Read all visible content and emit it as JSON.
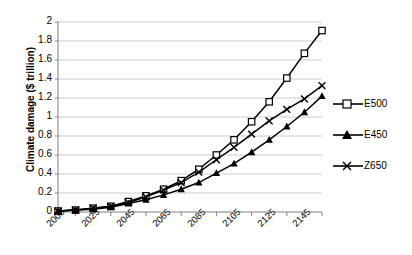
{
  "chart_data": {
    "type": "line",
    "title": "",
    "xlabel": "",
    "ylabel": "Climate damage ($ trillion)",
    "xlim": [
      2005,
      2155
    ],
    "ylim": [
      0,
      2
    ],
    "ytick_values": [
      0,
      0.2,
      0.4,
      0.6,
      0.8,
      1,
      1.2,
      1.4,
      1.6,
      1.8,
      2
    ],
    "ytick_labels": [
      "0",
      "0.2",
      "0.4",
      "0.6",
      "0.8",
      "1",
      "1.2",
      "1.4",
      "1.6",
      "1.8",
      "2"
    ],
    "xtick_labels": [
      "2005",
      "2025",
      "2045",
      "2065",
      "2085",
      "2105",
      "2125",
      "2145"
    ],
    "xtick_values": [
      2005,
      2025,
      2045,
      2065,
      2085,
      2105,
      2125,
      2145
    ],
    "x_minor_step": 10,
    "grid": "horizontal",
    "legend_position": "right",
    "x": [
      2005,
      2015,
      2025,
      2035,
      2045,
      2055,
      2065,
      2075,
      2085,
      2095,
      2105,
      2115,
      2125,
      2135,
      2145,
      2155
    ],
    "series": [
      {
        "name": "E500",
        "marker": "open-square",
        "values": [
          0.01,
          0.02,
          0.04,
          0.06,
          0.11,
          0.17,
          0.24,
          0.33,
          0.45,
          0.6,
          0.76,
          0.95,
          1.16,
          1.41,
          1.67,
          1.91
        ]
      },
      {
        "name": "E450",
        "marker": "filled-triangle",
        "values": [
          0.01,
          0.02,
          0.03,
          0.05,
          0.09,
          0.13,
          0.18,
          0.24,
          0.31,
          0.41,
          0.51,
          0.63,
          0.76,
          0.9,
          1.05,
          1.22
        ]
      },
      {
        "name": "Z650",
        "marker": "cross-x",
        "values": [
          0.01,
          0.02,
          0.04,
          0.06,
          0.1,
          0.16,
          0.23,
          0.31,
          0.42,
          0.55,
          0.68,
          0.82,
          0.96,
          1.08,
          1.19,
          1.33
        ]
      }
    ]
  },
  "legend": {
    "items": [
      {
        "label": "E500"
      },
      {
        "label": "E450"
      },
      {
        "label": "Z650"
      }
    ]
  },
  "colors": {
    "series": "#000000",
    "grid": "#bfbfbf",
    "axis": "#808080",
    "background": "#ffffff"
  }
}
